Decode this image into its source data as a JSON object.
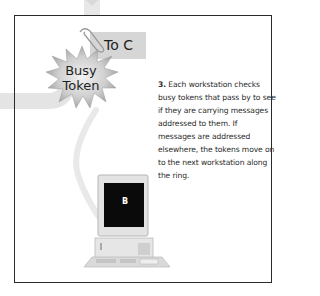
{
  "diagram": {
    "tag_label": "To C",
    "token_label_line1": "Busy",
    "token_label_line2": "Token",
    "step_number": "3.",
    "description": " Each workstation checks busy tokens that pass by to see if they are carrying messages addressed to them. If messages are addressed elsewhere, the tokens move on to the next workstation along the ring.",
    "workstation_label": "B",
    "colors": {
      "ring_path": "#e6e6e6",
      "frame_border": "#2a2a2a",
      "tag_bg": "#d6d6d6",
      "star_fill": "#bdbdbd",
      "screen": "#0a0a0a",
      "text": "#2b2b2b"
    }
  }
}
